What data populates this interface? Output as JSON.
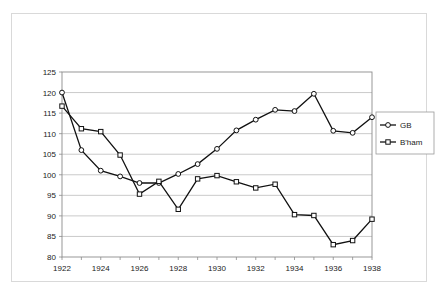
{
  "chart_data": {
    "type": "line",
    "title": "",
    "xlabel": "",
    "ylabel": "",
    "xlim": [
      1922,
      1938
    ],
    "ylim": [
      80,
      125
    ],
    "ytick_step": 5,
    "xtick_label_step": 2,
    "grid": true,
    "legend_position": "right",
    "x": [
      1922,
      1923,
      1924,
      1925,
      1926,
      1927,
      1928,
      1929,
      1930,
      1931,
      1932,
      1933,
      1934,
      1935,
      1936,
      1937,
      1938
    ],
    "xtick_labels": [
      "1922",
      "1924",
      "1926",
      "1928",
      "1930",
      "1932",
      "1934",
      "1936",
      "1938"
    ],
    "ytick_labels": [
      "80",
      "85",
      "90",
      "95",
      "100",
      "105",
      "110",
      "115",
      "120",
      "125"
    ],
    "series": [
      {
        "name": "GB",
        "marker": "circle",
        "color": "#111111",
        "values": [
          120.0,
          106.0,
          101.0,
          99.6,
          98.0,
          98.0,
          100.2,
          102.6,
          106.3,
          110.8,
          113.4,
          115.8,
          115.5,
          119.7,
          110.7,
          110.2,
          114.0
        ]
      },
      {
        "name": "B'ham",
        "marker": "square",
        "color": "#111111",
        "values": [
          116.7,
          111.2,
          110.5,
          104.8,
          95.3,
          98.4,
          91.6,
          99.0,
          99.8,
          98.3,
          96.8,
          97.7,
          90.3,
          90.1,
          83.0,
          84.0,
          89.2
        ]
      }
    ]
  },
  "legend": {
    "entries": [
      {
        "label": "GB",
        "marker": "circle"
      },
      {
        "label": "B'ham",
        "marker": "square"
      }
    ]
  }
}
